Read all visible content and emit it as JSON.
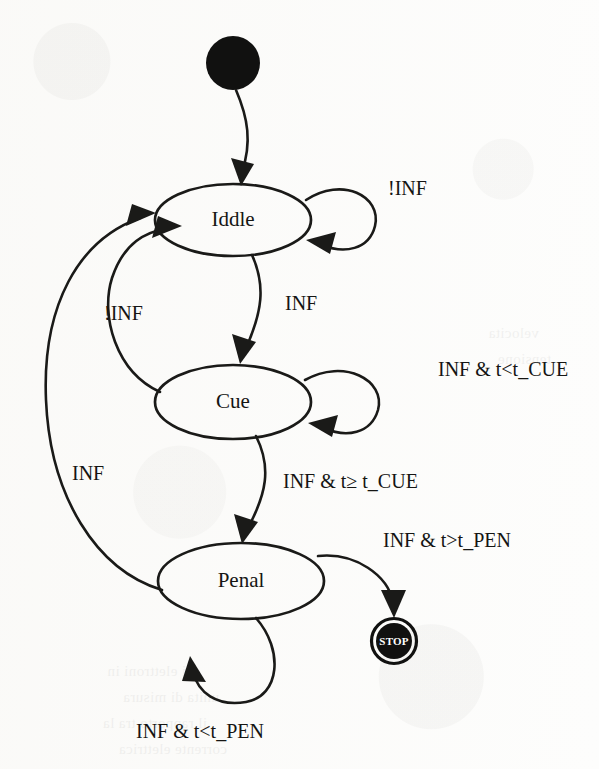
{
  "diagram": {
    "type": "state-machine",
    "title": "",
    "states": [
      {
        "id": "initial",
        "kind": "initial-pseudostate",
        "label": "",
        "cx": 233,
        "cy": 63,
        "r": 27
      },
      {
        "id": "iddle",
        "kind": "state",
        "label": "Iddle",
        "cx": 233,
        "cy": 220,
        "rx": 78,
        "ry": 36
      },
      {
        "id": "cue",
        "kind": "state",
        "label": "Cue",
        "cx": 233,
        "cy": 402,
        "rx": 78,
        "ry": 37
      },
      {
        "id": "penal",
        "kind": "state",
        "label": "Penal",
        "cx": 241,
        "cy": 581,
        "rx": 83,
        "ry": 38
      },
      {
        "id": "stop",
        "kind": "final-state",
        "label": "STOP",
        "cx": 394,
        "cy": 641,
        "r": 23
      }
    ],
    "transitions": [
      {
        "id": "t-init-iddle",
        "from": "initial",
        "to": "iddle",
        "label": ""
      },
      {
        "id": "t-iddle-self",
        "from": "iddle",
        "to": "iddle",
        "label": "!INF",
        "label_x": 388,
        "label_y": 190
      },
      {
        "id": "t-iddle-cue",
        "from": "iddle",
        "to": "cue",
        "label": "INF",
        "label_x": 285,
        "label_y": 305
      },
      {
        "id": "t-cue-iddle",
        "from": "cue",
        "to": "iddle",
        "label": "!INF",
        "label_x": 104,
        "label_y": 315
      },
      {
        "id": "t-cue-self",
        "from": "cue",
        "to": "cue",
        "label": "INF & t<t_CUE",
        "label_x": 438,
        "label_y": 371
      },
      {
        "id": "t-cue-penal",
        "from": "cue",
        "to": "penal",
        "label": "INF & t≥ t_CUE",
        "label_x": 283,
        "label_y": 483
      },
      {
        "id": "t-penal-iddle",
        "from": "penal",
        "to": "iddle",
        "label": "INF",
        "label_x": 72,
        "label_y": 475
      },
      {
        "id": "t-penal-stop",
        "from": "penal",
        "to": "stop",
        "label": "INF & t>t_PEN",
        "label_x": 383,
        "label_y": 542
      },
      {
        "id": "t-penal-self",
        "from": "penal",
        "to": "penal",
        "label": "INF & t<t_PEN",
        "label_x": 136,
        "label_y": 733
      }
    ],
    "colors": {
      "ink": "#1a1a18",
      "paper": "#fdfdfc",
      "final_fill": "#111110",
      "final_text": "#ffffff"
    },
    "bleed_through": [
      {
        "text": "di elettroni in",
        "x": 405,
        "y": 668
      },
      {
        "text": "unita di misura",
        "x": 380,
        "y": 694
      },
      {
        "text": "il rapporto tra la",
        "x": 392,
        "y": 720
      },
      {
        "text": "corrente elettrica",
        "x": 372,
        "y": 746
      },
      {
        "text": "velocita",
        "x": 60,
        "y": 330
      },
      {
        "text": "tensione",
        "x": 48,
        "y": 356
      }
    ]
  }
}
